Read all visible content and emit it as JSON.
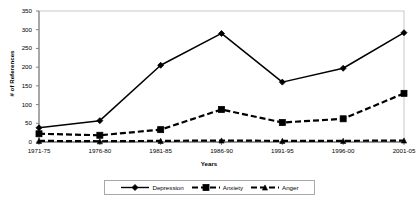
{
  "chart_data": {
    "type": "line",
    "title": "",
    "xlabel": "Years",
    "ylabel": "# of References",
    "categories": [
      "1971-75",
      "1976-80",
      "1981-85",
      "1986-90",
      "1991-95",
      "1996-00",
      "2001-05"
    ],
    "ylim": [
      0,
      350
    ],
    "ytick_step": 50,
    "yticks": [
      0,
      50,
      100,
      150,
      200,
      250,
      300,
      350
    ],
    "ytick_labels": [
      "0",
      "50",
      "100",
      "150",
      "200",
      "250",
      "300",
      "350"
    ],
    "grid": false,
    "legend_position": "bottom",
    "series": [
      {
        "name": "Depression",
        "values": [
          38,
          57,
          205,
          290,
          160,
          197,
          292
        ],
        "color": "#000000",
        "marker": "diamond",
        "linestyle": "solid"
      },
      {
        "name": "Anxiety",
        "values": [
          22,
          18,
          33,
          87,
          52,
          62,
          130
        ],
        "color": "#000000",
        "marker": "square",
        "linestyle": "dashed"
      },
      {
        "name": "Anger",
        "values": [
          3,
          2,
          3,
          4,
          3,
          3,
          4
        ],
        "color": "#000000",
        "marker": "triangle",
        "linestyle": "dashed"
      }
    ]
  },
  "axes": {
    "x_title": "Years",
    "y_title": "# of References"
  },
  "legend": {
    "items": [
      {
        "label": "Depression"
      },
      {
        "label": "Anxiety"
      },
      {
        "label": "Anger"
      }
    ]
  },
  "colors": {
    "line": "#000000",
    "axis": "#808080",
    "legend_border": "#a8a8a8",
    "background": "#ffffff"
  }
}
